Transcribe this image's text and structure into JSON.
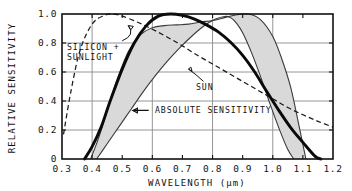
{
  "chart_data": {
    "type": "line",
    "title": "",
    "xlabel": "WAVELENGTH  (μm)",
    "ylabel": "RELATIVE SENSITIVITY",
    "xlim": [
      0.3,
      1.2
    ],
    "ylim": [
      0.0,
      1.0
    ],
    "grid": true,
    "legend_position": "inline-annotations",
    "xticks": [
      "0.3",
      "0.4",
      "0.5",
      "0.6",
      "0.7",
      "0.8",
      "0.9",
      "1.0",
      "1.1",
      "1.2"
    ],
    "xtick_values": [
      0.3,
      0.4,
      0.5,
      0.6,
      0.7,
      0.8,
      0.9,
      1.0,
      1.1,
      1.2
    ],
    "yticks": [
      "0",
      "0.2",
      "0.4",
      "0.6",
      "0.8",
      "1.0"
    ],
    "ytick_values": [
      0,
      0.2,
      0.4,
      0.6,
      0.8,
      1.0
    ],
    "xgridlines": [
      0.4,
      0.6,
      0.8,
      1.0
    ],
    "ygridlines": [
      0.2,
      0.4,
      0.6,
      0.8
    ],
    "annotations": [
      {
        "id": "silicon-sunlight",
        "text_line1": "SILICON +",
        "text_line2": "SUNLIGHT",
        "x": 0.345,
        "y": 0.74,
        "leader_to": [
          0.52,
          0.92
        ]
      },
      {
        "id": "sun",
        "text": "SUN",
        "x": 0.775,
        "y": 0.5,
        "leader_to": [
          0.72,
          0.62
        ]
      },
      {
        "id": "absolute-sensitivity",
        "text": "ABSOLUTE SENSITIVITY",
        "x": 0.6,
        "y": 0.335,
        "leader_to": [
          0.535,
          0.335
        ],
        "arrow": "left"
      }
    ],
    "series": [
      {
        "name": "SUN",
        "style": "dashed",
        "color": "#1a1a1a",
        "x": [
          0.305,
          0.33,
          0.36,
          0.4,
          0.44,
          0.47,
          0.5,
          0.55,
          0.6,
          0.65,
          0.7,
          0.75,
          0.8,
          0.85,
          0.9,
          0.95,
          1.0,
          1.05,
          1.1,
          1.15,
          1.2
        ],
        "y": [
          0.17,
          0.47,
          0.75,
          0.93,
          0.99,
          1.0,
          0.985,
          0.945,
          0.895,
          0.84,
          0.78,
          0.715,
          0.655,
          0.595,
          0.535,
          0.475,
          0.415,
          0.355,
          0.305,
          0.26,
          0.22
        ]
      },
      {
        "name": "ABSOLUTE SENSITIVITY",
        "style": "thick-solid",
        "color": "#0a0a0a",
        "x": [
          0.375,
          0.4,
          0.43,
          0.46,
          0.5,
          0.54,
          0.58,
          0.62,
          0.66,
          0.7,
          0.74,
          0.78,
          0.82,
          0.86,
          0.9,
          0.94,
          0.98,
          1.02,
          1.06,
          1.1,
          1.14,
          1.16
        ],
        "y": [
          0.0,
          0.085,
          0.22,
          0.4,
          0.62,
          0.8,
          0.92,
          0.985,
          1.0,
          0.99,
          0.965,
          0.925,
          0.875,
          0.805,
          0.715,
          0.6,
          0.465,
          0.335,
          0.215,
          0.115,
          0.02,
          0.0
        ]
      },
      {
        "name": "SILICON + SUNLIGHT upper bound",
        "style": "thin-solid",
        "color": "#3a3a3a",
        "x": [
          0.395,
          0.42,
          0.45,
          0.48,
          0.52,
          0.56,
          0.6,
          0.64,
          0.68,
          0.72,
          0.76,
          0.8,
          0.84,
          0.88,
          0.92,
          0.96,
          1.0,
          1.03,
          1.06,
          1.09,
          1.11
        ],
        "y": [
          0.0,
          0.135,
          0.33,
          0.53,
          0.74,
          0.855,
          0.905,
          0.92,
          0.925,
          0.93,
          0.945,
          0.955,
          0.975,
          0.995,
          1.0,
          0.96,
          0.845,
          0.69,
          0.49,
          0.2,
          0.0
        ]
      },
      {
        "name": "SILICON + SUNLIGHT lower bound",
        "style": "thin-solid",
        "color": "#3a3a3a",
        "x": [
          0.415,
          0.45,
          0.49,
          0.53,
          0.57,
          0.61,
          0.65,
          0.69,
          0.73,
          0.77,
          0.81,
          0.84,
          0.86,
          0.88,
          0.9,
          0.93,
          0.96,
          0.99,
          1.02,
          1.05,
          1.07
        ],
        "y": [
          0.0,
          0.105,
          0.225,
          0.345,
          0.465,
          0.575,
          0.675,
          0.765,
          0.845,
          0.915,
          0.965,
          0.983,
          0.975,
          0.935,
          0.87,
          0.73,
          0.565,
          0.385,
          0.215,
          0.065,
          0.0
        ]
      }
    ],
    "band": {
      "name": "SILICON + SUNLIGHT response band",
      "fill_color": "#d9d9d9",
      "between": [
        "SILICON + SUNLIGHT upper bound",
        "SILICON + SUNLIGHT lower bound"
      ]
    },
    "colors": {
      "axis": "#111111",
      "grid": "#8a8a8a",
      "band_fill": "#d9d9d9",
      "background": "#ffffff"
    }
  }
}
